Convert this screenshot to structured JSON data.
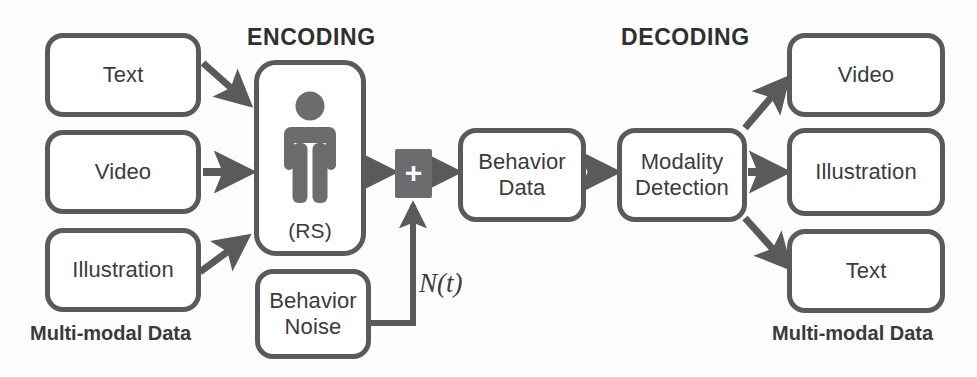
{
  "diagram": {
    "title_encoding": "ENCODING",
    "title_decoding": "DECODING",
    "caption_left": "Multi-modal Data",
    "caption_right": "Multi-modal Data",
    "noise_label": "N(t)",
    "colors": {
      "stroke": "#5a5a5c",
      "text": "#3b3b3d",
      "fill": "#ffffff",
      "sum_fill": "#6c6c6e",
      "background": "#fdfdfd"
    }
  },
  "inputs": [
    {
      "label": "Text"
    },
    {
      "label": "Video"
    },
    {
      "label": "Illustration"
    }
  ],
  "encoder": {
    "icon": "person-icon",
    "sublabel": "(RS)"
  },
  "sum": {
    "symbol": "+"
  },
  "pipeline": [
    {
      "line1": "Behavior",
      "line2": "Data"
    },
    {
      "line1": "Modality",
      "line2": "Detection"
    }
  ],
  "noise_source": {
    "line1": "Behavior",
    "line2": "Noise"
  },
  "outputs": [
    {
      "label": "Video"
    },
    {
      "label": "Illustration"
    },
    {
      "label": "Text"
    }
  ]
}
